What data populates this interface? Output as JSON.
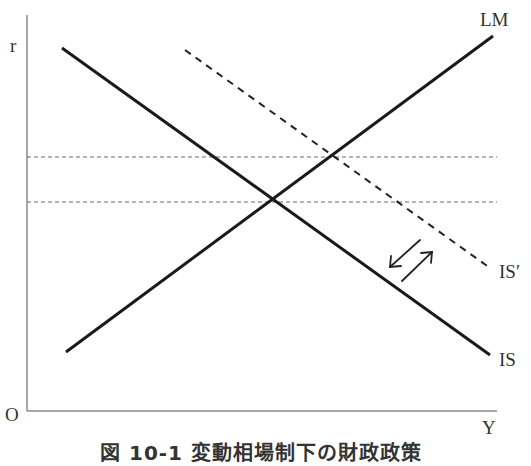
{
  "diagram": {
    "type": "IS-LM diagram",
    "axes": {
      "y_label": "r",
      "x_label": "Y",
      "origin_label": "O"
    },
    "curves": [
      {
        "name": "IS",
        "label": "IS",
        "style": "solid",
        "slope": "downward"
      },
      {
        "name": "LM",
        "label": "LM",
        "style": "solid",
        "slope": "upward"
      },
      {
        "name": "IS_prime",
        "label": "IS′",
        "style": "dashed",
        "slope": "downward"
      }
    ],
    "reference_lines": [
      {
        "name": "upper-interest-rate-level",
        "style": "dashed",
        "orientation": "horizontal",
        "through": "IS′ ∩ LM"
      },
      {
        "name": "lower-interest-rate-level",
        "style": "dashed",
        "orientation": "horizontal",
        "through": "IS ∩ LM"
      }
    ],
    "arrows": [
      {
        "name": "shift-back-arrow",
        "direction": "down-left",
        "meaning": "IS′ shifts back to IS"
      },
      {
        "name": "shift-out-arrow",
        "direction": "up-right",
        "meaning": "IS shifts out to IS′"
      }
    ],
    "caption": "図 10-1  変動相場制下の財政政策"
  },
  "colors": {
    "curve": "#1a1a1a",
    "axis": "#888888",
    "dashed": "#555555",
    "text": "#333333",
    "background": "#ffffff"
  }
}
